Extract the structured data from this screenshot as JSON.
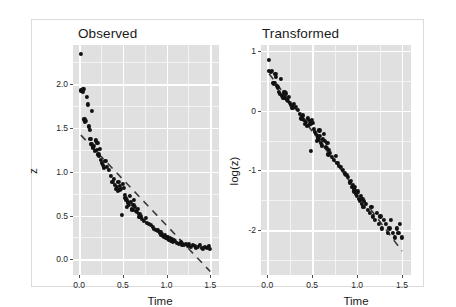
{
  "figure": {
    "background": "#ffffff",
    "panel_fill": "#e0e0e0",
    "grid_color": "#ffffff",
    "point_color": "#111111",
    "trend_color": "#3a3a3a"
  },
  "chart_data": [
    {
      "type": "scatter",
      "title": "Observed",
      "xlabel": "Time",
      "ylabel": "z",
      "xlim": [
        -0.07,
        1.6
      ],
      "ylim": [
        -0.18,
        2.45
      ],
      "xticks": [
        0.0,
        0.5,
        1.0,
        1.5
      ],
      "xtick_labels": [
        "0.0",
        "0.5",
        "1.0",
        "1.5"
      ],
      "yticks": [
        0.0,
        0.5,
        1.0,
        1.5,
        2.0
      ],
      "ytick_labels": [
        "0.0",
        "0.5",
        "1.0",
        "1.5",
        "2.0"
      ],
      "grid": true,
      "legend": "none",
      "trendline": {
        "style": "dashed",
        "x": [
          0.02,
          1.5
        ],
        "y": [
          1.42,
          -0.14
        ]
      },
      "x": [
        0.02,
        0.02,
        0.04,
        0.05,
        0.06,
        0.07,
        0.08,
        0.09,
        0.1,
        0.11,
        0.12,
        0.13,
        0.14,
        0.15,
        0.16,
        0.17,
        0.18,
        0.19,
        0.2,
        0.21,
        0.22,
        0.23,
        0.24,
        0.25,
        0.26,
        0.27,
        0.28,
        0.3,
        0.32,
        0.34,
        0.36,
        0.38,
        0.4,
        0.41,
        0.42,
        0.43,
        0.44,
        0.45,
        0.46,
        0.47,
        0.48,
        0.49,
        0.5,
        0.51,
        0.52,
        0.53,
        0.54,
        0.55,
        0.56,
        0.57,
        0.58,
        0.59,
        0.6,
        0.61,
        0.62,
        0.63,
        0.64,
        0.65,
        0.66,
        0.67,
        0.68,
        0.69,
        0.7,
        0.72,
        0.74,
        0.76,
        0.78,
        0.8,
        0.82,
        0.84,
        0.86,
        0.88,
        0.9,
        0.92,
        0.93,
        0.94,
        0.95,
        0.96,
        0.97,
        0.98,
        0.99,
        1.0,
        1.01,
        1.02,
        1.03,
        1.04,
        1.05,
        1.06,
        1.07,
        1.08,
        1.1,
        1.12,
        1.14,
        1.16,
        1.18,
        1.2,
        1.22,
        1.24,
        1.26,
        1.28,
        1.3,
        1.32,
        1.34,
        1.36,
        1.38,
        1.4,
        1.42,
        1.44,
        1.46,
        1.48,
        1.5
      ],
      "y": [
        2.35,
        1.93,
        1.92,
        1.95,
        1.6,
        1.57,
        1.58,
        1.86,
        1.77,
        1.52,
        1.48,
        1.38,
        1.32,
        1.7,
        1.28,
        1.3,
        1.24,
        1.36,
        1.25,
        1.33,
        1.2,
        1.18,
        1.26,
        1.14,
        1.1,
        1.08,
        1.05,
        1.12,
        1.06,
        1.02,
        0.95,
        0.88,
        0.92,
        0.85,
        0.8,
        0.83,
        0.78,
        0.88,
        0.79,
        0.84,
        0.8,
        0.51,
        0.86,
        0.82,
        0.74,
        0.7,
        0.68,
        0.6,
        0.65,
        0.62,
        0.72,
        0.66,
        0.58,
        0.56,
        0.62,
        0.68,
        0.6,
        0.55,
        0.54,
        0.58,
        0.48,
        0.52,
        0.49,
        0.46,
        0.44,
        0.47,
        0.42,
        0.4,
        0.39,
        0.37,
        0.35,
        0.34,
        0.33,
        0.3,
        0.31,
        0.28,
        0.29,
        0.27,
        0.26,
        0.28,
        0.25,
        0.24,
        0.26,
        0.23,
        0.22,
        0.24,
        0.21,
        0.23,
        0.2,
        0.22,
        0.21,
        0.19,
        0.18,
        0.2,
        0.17,
        0.16,
        0.18,
        0.15,
        0.17,
        0.14,
        0.16,
        0.15,
        0.13,
        0.14,
        0.16,
        0.13,
        0.12,
        0.14,
        0.13,
        0.15,
        0.12
      ]
    },
    {
      "type": "scatter",
      "title": "Transformed",
      "xlabel": "Time",
      "ylabel": "log(z)",
      "xlim": [
        -0.07,
        1.6
      ],
      "ylim": [
        -2.75,
        1.1
      ],
      "xticks": [
        0.0,
        0.5,
        1.0,
        1.5
      ],
      "xtick_labels": [
        "0.0",
        "0.5",
        "1.0",
        "1.5"
      ],
      "yticks": [
        -2,
        -1,
        0,
        1
      ],
      "ytick_labels": [
        "-2",
        "-1",
        "0",
        "1"
      ],
      "grid": true,
      "legend": "none",
      "trendline": {
        "style": "dashed",
        "x": [
          0.02,
          1.5
        ],
        "y": [
          0.62,
          -2.35
        ]
      },
      "x": [
        0.02,
        0.02,
        0.04,
        0.05,
        0.06,
        0.07,
        0.08,
        0.09,
        0.1,
        0.11,
        0.12,
        0.13,
        0.14,
        0.15,
        0.16,
        0.17,
        0.18,
        0.19,
        0.2,
        0.21,
        0.22,
        0.23,
        0.24,
        0.25,
        0.26,
        0.27,
        0.28,
        0.3,
        0.32,
        0.34,
        0.36,
        0.38,
        0.4,
        0.41,
        0.42,
        0.43,
        0.44,
        0.45,
        0.46,
        0.47,
        0.48,
        0.49,
        0.5,
        0.51,
        0.52,
        0.53,
        0.54,
        0.55,
        0.56,
        0.57,
        0.58,
        0.59,
        0.6,
        0.61,
        0.62,
        0.63,
        0.64,
        0.65,
        0.66,
        0.67,
        0.68,
        0.69,
        0.7,
        0.72,
        0.74,
        0.76,
        0.78,
        0.8,
        0.82,
        0.84,
        0.86,
        0.88,
        0.9,
        0.92,
        0.93,
        0.94,
        0.95,
        0.96,
        0.97,
        0.98,
        0.99,
        1.0,
        1.01,
        1.02,
        1.03,
        1.04,
        1.05,
        1.06,
        1.07,
        1.08,
        1.1,
        1.12,
        1.14,
        1.16,
        1.18,
        1.2,
        1.22,
        1.24,
        1.26,
        1.28,
        1.3,
        1.32,
        1.34,
        1.36,
        1.38,
        1.4,
        1.42,
        1.44,
        1.46,
        1.48,
        1.5
      ],
      "y": [
        0.85,
        0.66,
        0.65,
        0.67,
        0.47,
        0.45,
        0.46,
        0.62,
        0.57,
        0.42,
        0.39,
        0.32,
        0.28,
        0.53,
        0.25,
        0.26,
        0.22,
        0.31,
        0.22,
        0.29,
        0.18,
        0.17,
        0.23,
        0.13,
        0.1,
        0.08,
        0.05,
        0.11,
        0.06,
        0.02,
        -0.05,
        -0.13,
        -0.08,
        -0.16,
        -0.22,
        -0.19,
        -0.25,
        -0.13,
        -0.24,
        -0.17,
        -0.22,
        -0.67,
        -0.15,
        -0.2,
        -0.3,
        -0.36,
        -0.39,
        -0.51,
        -0.43,
        -0.48,
        -0.33,
        -0.42,
        -0.54,
        -0.58,
        -0.48,
        -0.39,
        -0.51,
        -0.6,
        -0.62,
        -0.54,
        -0.73,
        -0.65,
        -0.71,
        -0.78,
        -0.82,
        -0.76,
        -0.87,
        -0.92,
        -0.94,
        -0.99,
        -1.05,
        -1.08,
        -1.11,
        -1.2,
        -1.17,
        -1.27,
        -1.24,
        -1.31,
        -1.35,
        -1.27,
        -1.39,
        -1.43,
        -1.35,
        -1.47,
        -1.51,
        -1.43,
        -1.56,
        -1.47,
        -1.61,
        -1.51,
        -1.56,
        -1.66,
        -1.71,
        -1.61,
        -1.77,
        -1.83,
        -1.71,
        -1.9,
        -1.77,
        -1.97,
        -1.83,
        -1.9,
        -2.04,
        -1.97,
        -1.83,
        -2.04,
        -2.12,
        -1.97,
        -2.04,
        -1.9,
        -2.12
      ]
    }
  ]
}
